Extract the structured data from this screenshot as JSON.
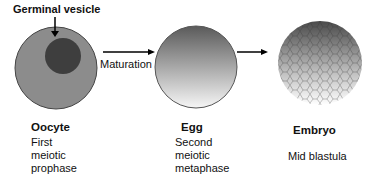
{
  "diagram": {
    "germinal_vesicle_label": "Germinal vesicle",
    "arrow_label": "Maturation",
    "stages": [
      {
        "name": "Oocyte",
        "desc": [
          "First",
          "meiotic",
          "prophase"
        ]
      },
      {
        "name": "Egg",
        "desc": [
          "Second",
          "meiotic",
          "metaphase"
        ]
      },
      {
        "name": "Embryo",
        "desc": [
          "Mid blastula"
        ]
      }
    ],
    "colors": {
      "oocyte": "#8a8a8a",
      "nucleus": "#3c3c3c",
      "egg_dark": "#555555",
      "egg_light": "#f4f4f4"
    }
  }
}
